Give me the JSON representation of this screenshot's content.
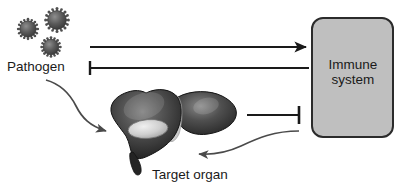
{
  "diagram": {
    "canvas": {
      "width": 399,
      "height": 193,
      "background": "#ffffff"
    },
    "nodes": {
      "pathogen": {
        "label": "Pathogen",
        "icon": "virus-particles-icon",
        "particle_count": 3,
        "color": "#4a4a4a"
      },
      "target_organ": {
        "label": "Target organ",
        "icon": "liver-organ-icon",
        "color": "#3a3a3a",
        "highlight_color": "#d8d8d8"
      },
      "immune_system": {
        "label_line1": "Immune",
        "label_line2": "system",
        "shape": "rounded-rectangle",
        "fill": "#bfbfbf",
        "stroke": "#2b2b2b"
      }
    },
    "connectors": [
      {
        "id": "pathogen-to-immune",
        "name": "arrow-pathogen-to-immune-system",
        "from": "pathogen",
        "to": "immune_system",
        "style": "straight",
        "head": "arrow",
        "direction": "right",
        "color": "#1a1a1a"
      },
      {
        "id": "immune-inhibits-pathogen",
        "name": "inhibition-immune-system-to-pathogen",
        "from": "immune_system",
        "to": "pathogen",
        "style": "straight",
        "head": "t-bar",
        "direction": "left",
        "color": "#1a1a1a"
      },
      {
        "id": "pathogen-to-target-organ",
        "name": "curved-arrow-pathogen-to-target-organ",
        "from": "pathogen",
        "to": "target_organ",
        "style": "curved",
        "head": "arrow",
        "direction": "down-right",
        "color": "#4a4a4a"
      },
      {
        "id": "organ-inhibits-immune",
        "name": "inhibition-target-organ-to-immune-system",
        "from": "target_organ",
        "to": "immune_system",
        "style": "straight",
        "head": "t-bar",
        "direction": "right",
        "color": "#1a1a1a"
      },
      {
        "id": "immune-to-target-organ",
        "name": "curved-arrow-immune-system-to-target-organ",
        "from": "immune_system",
        "to": "target_organ",
        "style": "curved",
        "head": "arrow",
        "direction": "left",
        "color": "#4a4a4a"
      }
    ]
  }
}
